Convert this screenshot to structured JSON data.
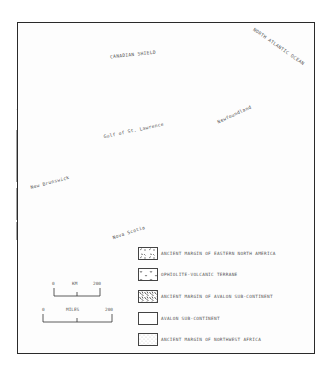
{
  "map": {
    "region_labels": {
      "canadian_shield": "CANADIAN SHIELD",
      "north_atlantic": "NORTH ATLANTIC OCEAN",
      "gulf": "Gulf of St. Lawrence",
      "newfoundland": "Newfoundland",
      "new_brunswick": "New Brunswick",
      "nova_scotia": "Nova Scotia"
    },
    "colors": {
      "line": "#1a1a1a",
      "texture": "#333333",
      "background": "#ffffff"
    }
  },
  "scale": {
    "km": {
      "start": "0",
      "unit": "KM",
      "end": "200"
    },
    "miles": {
      "start": "0",
      "unit": "MILES",
      "end": "200"
    }
  },
  "legend": {
    "items": [
      {
        "pattern": "dashes",
        "label": "ANCIENT MARGIN OF EASTERN NORTH AMERICA"
      },
      {
        "pattern": "v-marks",
        "label": "OPHIOLITE-VOLCANIC TERRANE"
      },
      {
        "pattern": "dense-dashes",
        "label": "ANCIENT MARGIN OF AVALON SUB-CONTINENT"
      },
      {
        "pattern": "blank",
        "label": "AVALON SUB-CONTINENT"
      },
      {
        "pattern": "dots",
        "label": "ANCIENT MARGIN OF NORTHWEST AFRICA"
      }
    ]
  }
}
